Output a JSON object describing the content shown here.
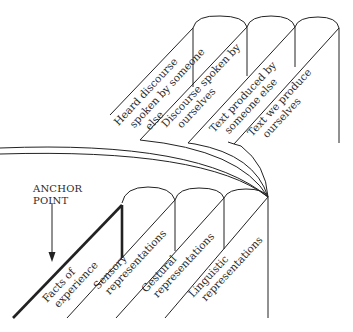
{
  "diagram": {
    "type": "two stacked folded-panel (book-page) structures linked by converging curves",
    "anchor": {
      "line1": "ANCHOR",
      "line2": "POINT"
    },
    "top_panels": [
      {
        "line1": "Heard discourse",
        "line2": "spoken by someone",
        "line3": "else"
      },
      {
        "line1": "Discourse spoken by",
        "line2": "ourselves"
      },
      {
        "line1": "Text produced by",
        "line2": "someone else"
      },
      {
        "line1": "Text we produce",
        "line2": "ourselves"
      }
    ],
    "bottom_panels": [
      {
        "line1": "Facts of",
        "line2": "experience"
      },
      {
        "line1": "Sensory",
        "line2": "representations"
      },
      {
        "line1": "Gestural",
        "line2": "representations"
      },
      {
        "line1": "Linguistic",
        "line2": "representations"
      }
    ],
    "colors": {
      "line": "#222222",
      "text": "#2a2a2a",
      "background": "#ffffff"
    }
  }
}
